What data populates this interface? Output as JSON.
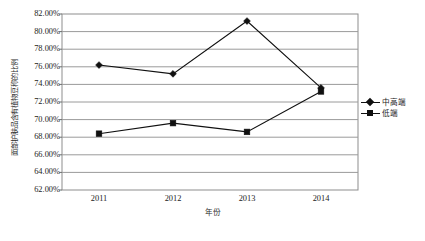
{
  "chart_data": {
    "type": "line",
    "title": "",
    "xlabel": "年份",
    "ylabel": "面部护肤品含有植物豆称的比例",
    "categories": [
      "2011",
      "2012",
      "2013",
      "2014"
    ],
    "ylim": [
      62,
      82
    ],
    "ytick_step": 2,
    "ytick_labels": [
      "82.00%",
      "80.00%",
      "78.00%",
      "76.00%",
      "74.00%",
      "72.00%",
      "70.00%",
      "68.00%",
      "66.00%",
      "64.00%",
      "62.00%"
    ],
    "ytick_values": [
      82,
      80,
      78,
      76,
      74,
      72,
      70,
      68,
      66,
      64,
      62
    ],
    "grid": true,
    "grid_axis": "y",
    "legend_position": "right",
    "series": [
      {
        "name": "中高端",
        "marker": "diamond",
        "color": "#101010",
        "values": [
          76.2,
          75.2,
          81.2,
          73.6
        ]
      },
      {
        "name": "低端",
        "marker": "square",
        "color": "#101010",
        "values": [
          68.4,
          69.6,
          68.6,
          73.2
        ]
      }
    ]
  }
}
